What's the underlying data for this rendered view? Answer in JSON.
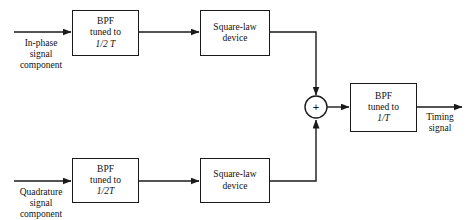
{
  "diagram": {
    "stroke_color": "#1a1a1a",
    "background": "#ffffff",
    "blocks": {
      "bpf_inphase": {
        "line1": "BPF",
        "line2": "tuned to",
        "line3": "1/2 T"
      },
      "sqlaw_inphase": {
        "line1": "Square-law",
        "line2": "device"
      },
      "bpf_quadrature": {
        "line1": "BPF",
        "line2": "tuned to",
        "line3": "1/2T"
      },
      "sqlaw_quadrature": {
        "line1": "Square-law",
        "line2": "device"
      },
      "bpf_output": {
        "line1": "BPF",
        "line2": "tuned to",
        "line3": "1/T"
      }
    },
    "summer": {
      "symbol": "+",
      "name": "summing-junction"
    },
    "labels": {
      "input_inphase": {
        "line1": "In-phase",
        "line2": "signal",
        "line3": "component"
      },
      "input_quadrature": {
        "line1": "Quadrature",
        "line2": "signal",
        "line3": "component"
      },
      "output": {
        "line1": "Timing",
        "line2": "signal"
      }
    }
  }
}
